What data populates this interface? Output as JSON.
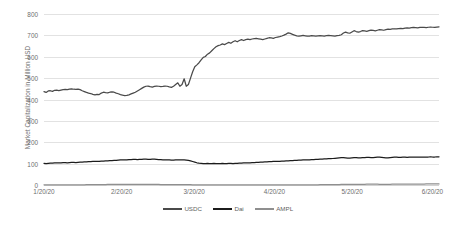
{
  "chart_data": {
    "type": "line",
    "title": "",
    "xlabel": "",
    "ylabel": "Market Capitalization in Million USD",
    "ylim": [
      0,
      800
    ],
    "ytick_values": [
      0,
      100,
      200,
      300,
      400,
      500,
      600,
      700,
      800
    ],
    "ytick_labels": [
      "0",
      "100",
      "200",
      "300",
      "400",
      "500",
      "600",
      "700",
      "800"
    ],
    "xtick_labels": [
      "1/20/20",
      "2/20/20",
      "3/20/20",
      "4/20/20",
      "5/20/20",
      "6/20/20"
    ],
    "xtick_positions": [
      0,
      0.1967,
      0.3803,
      0.5836,
      0.7803,
      0.9836
    ],
    "grid": "horizontal",
    "legend_position": "bottom-center",
    "series": [
      {
        "name": "USDC",
        "color": "#4a4a4a",
        "values": [
          437,
          433,
          440,
          441,
          438,
          443,
          444,
          442,
          444,
          446,
          447,
          446,
          449,
          450,
          448,
          447,
          449,
          446,
          441,
          437,
          433,
          430,
          428,
          424,
          422,
          424,
          423,
          430,
          434,
          432,
          431,
          434,
          436,
          434,
          430,
          427,
          423,
          420,
          418,
          419,
          422,
          426,
          430,
          434,
          440,
          446,
          452,
          458,
          462,
          463,
          460,
          458,
          461,
          463,
          462,
          460,
          461,
          463,
          462,
          459,
          457,
          462,
          470,
          478,
          462,
          470,
          497,
          462,
          470,
          500,
          530,
          553,
          562,
          572,
          585,
          597,
          601,
          612,
          618,
          628,
          638,
          647,
          652,
          655,
          660,
          657,
          662,
          667,
          663,
          670,
          675,
          670,
          676,
          680,
          676,
          680,
          682,
          680,
          683,
          685,
          686,
          684,
          682,
          680,
          683,
          686,
          689,
          688,
          686,
          690,
          692,
          694,
          697,
          701,
          706,
          712,
          709,
          705,
          701,
          698,
          696,
          698,
          700,
          698,
          696,
          697,
          699,
          698,
          697,
          698,
          699,
          698,
          697,
          699,
          700,
          699,
          698,
          697,
          699,
          700,
          703,
          711,
          715,
          712,
          710,
          716,
          722,
          718,
          715,
          718,
          722,
          721,
          719,
          722,
          725,
          723,
          721,
          724,
          727,
          726,
          724,
          727,
          729,
          728,
          730,
          731,
          730,
          732,
          733,
          732,
          734,
          735,
          734,
          736,
          737,
          736,
          735,
          737,
          738,
          737,
          736,
          738,
          739,
          738,
          737,
          739,
          740
        ]
      },
      {
        "name": "Dai",
        "color": "#1c1c1c",
        "values": [
          101,
          100,
          101,
          102,
          102,
          103,
          103,
          104,
          104,
          105,
          105,
          104,
          105,
          106,
          106,
          105,
          106,
          107,
          107,
          108,
          108,
          109,
          109,
          110,
          110,
          111,
          111,
          112,
          112,
          113,
          113,
          114,
          114,
          115,
          115,
          116,
          117,
          117,
          118,
          118,
          119,
          119,
          120,
          120,
          119,
          120,
          120,
          121,
          121,
          120,
          120,
          121,
          121,
          120,
          119,
          119,
          118,
          118,
          117,
          117,
          116,
          116,
          117,
          118,
          118,
          117,
          117,
          116,
          115,
          113,
          110,
          107,
          104,
          102,
          101,
          100,
          100,
          101,
          100,
          100,
          101,
          100,
          100,
          100,
          101,
          100,
          100,
          101,
          101,
          100,
          101,
          101,
          102,
          102,
          103,
          103,
          104,
          104,
          105,
          105,
          106,
          106,
          107,
          107,
          108,
          108,
          109,
          109,
          110,
          110,
          111,
          111,
          112,
          112,
          113,
          113,
          114,
          114,
          115,
          115,
          116,
          116,
          117,
          117,
          118,
          118,
          119,
          119,
          120,
          120,
          121,
          121,
          122,
          122,
          123,
          123,
          124,
          125,
          126,
          127,
          128,
          128,
          127,
          126,
          126,
          127,
          128,
          128,
          127,
          127,
          128,
          128,
          129,
          129,
          128,
          128,
          129,
          130,
          130,
          129,
          128,
          127,
          127,
          128,
          129,
          130,
          130,
          129,
          129,
          130,
          130,
          129,
          130,
          130,
          131,
          131,
          130,
          131,
          131,
          130,
          131,
          131,
          132,
          131,
          131,
          132,
          132
        ]
      },
      {
        "name": "AMPL",
        "color": "#8f8f8f",
        "values": [
          1,
          1,
          1,
          1,
          1,
          1,
          1,
          1,
          1,
          1,
          1,
          1,
          1,
          1,
          1,
          1,
          1,
          1,
          1,
          1,
          2,
          2,
          2,
          2,
          2,
          2,
          2,
          2,
          2,
          2,
          3,
          3,
          3,
          3,
          3,
          3,
          3,
          3,
          3,
          3,
          3,
          3,
          3,
          3,
          3,
          3,
          3,
          3,
          3,
          3,
          3,
          3,
          3,
          3,
          3,
          2,
          2,
          2,
          2,
          2,
          2,
          2,
          2,
          2,
          2,
          2,
          2,
          2,
          2,
          2,
          1,
          1,
          1,
          1,
          1,
          1,
          1,
          1,
          1,
          1,
          1,
          1,
          1,
          1,
          1,
          1,
          1,
          1,
          1,
          1,
          1,
          1,
          1,
          1,
          1,
          1,
          1,
          1,
          1,
          1,
          1,
          1,
          1,
          1,
          1,
          1,
          1,
          1,
          1,
          1,
          1,
          1,
          1,
          1,
          1,
          1,
          1,
          1,
          1,
          1,
          1,
          1,
          1,
          1,
          1,
          1,
          1,
          1,
          1,
          1,
          2,
          2,
          2,
          2,
          2,
          2,
          2,
          2,
          2,
          2,
          3,
          3,
          3,
          3,
          3,
          3,
          3,
          3,
          3,
          3,
          3,
          3,
          4,
          4,
          4,
          4,
          4,
          4,
          3,
          3,
          3,
          3,
          3,
          3,
          4,
          4,
          4,
          4,
          4,
          4,
          4,
          4,
          4,
          4,
          4,
          4,
          4,
          4,
          4,
          4,
          5,
          5,
          5,
          5,
          5,
          5,
          5
        ]
      }
    ]
  },
  "legend": {
    "items": [
      {
        "label": "USDC",
        "color": "#4a4a4a"
      },
      {
        "label": "Dai",
        "color": "#1c1c1c"
      },
      {
        "label": "AMPL",
        "color": "#8f8f8f"
      }
    ]
  },
  "axis": {
    "y_title": "Market Capitalization in Million USD"
  }
}
